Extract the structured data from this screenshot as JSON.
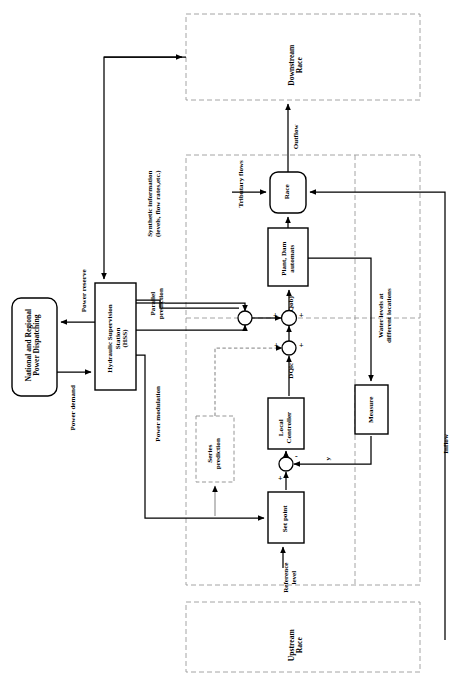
{
  "diagram": {
    "orientation": "rotated-90",
    "blocks": {
      "dispatching": "National and Regional\nPower Dispatching",
      "hss": "Hydraulic Supervision\nStation\n(HSS)",
      "race": "Race",
      "plant_dam": "Plant, Dam\nautomats",
      "measure": "Measure",
      "local_controller": "Local\nController",
      "set_point": "Set point",
      "series_prediction": "Series\nprediction",
      "downstream_race": "Downstream\nRace",
      "upstream_race": "Upstream\nRace"
    },
    "signals": {
      "power_reserve": "Power reserve",
      "power_demand": "Power demand",
      "power_modulation": "Power modulation",
      "synthetic_information": "Synthetic information\n(levels, flow rates,etc.)",
      "parallel_prediction": "Parallel\nprediction",
      "qobj": "Qobj",
      "dqlc": "DQlc",
      "outflow": "Outflow",
      "inflow": "Inflow",
      "tributary_flows": "Tributary flows",
      "water_levels": "Water levels at\ndifferent locations",
      "reference_level": "Reference\nlevel",
      "y": "y"
    },
    "junction_signs": {
      "plus": "+",
      "minus": "-"
    },
    "colors": {
      "line": "#000000",
      "background": "#ffffff",
      "dashed": "#8a8a8a"
    }
  }
}
